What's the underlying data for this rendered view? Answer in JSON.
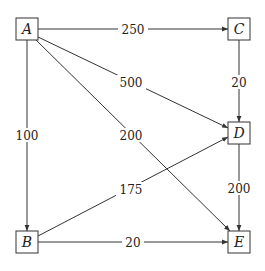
{
  "diagram": {
    "type": "weighted-directed-graph",
    "nodes": [
      {
        "id": "A",
        "label": "A",
        "x": 27,
        "y": 29
      },
      {
        "id": "B",
        "label": "B",
        "x": 27,
        "y": 242
      },
      {
        "id": "C",
        "label": "C",
        "x": 239,
        "y": 29
      },
      {
        "id": "D",
        "label": "D",
        "x": 239,
        "y": 133
      },
      {
        "id": "E",
        "label": "E",
        "x": 239,
        "y": 242
      }
    ],
    "edges": [
      {
        "from": "A",
        "to": "C",
        "weight": "250",
        "label_x": 133,
        "label_y": 29
      },
      {
        "from": "A",
        "to": "D",
        "weight": "500",
        "label_x": 131,
        "label_y": 82
      },
      {
        "from": "A",
        "to": "E",
        "weight": "200",
        "label_x": 131,
        "label_y": 135
      },
      {
        "from": "A",
        "to": "B",
        "weight": "100",
        "label_x": 27,
        "label_y": 135
      },
      {
        "from": "C",
        "to": "D",
        "weight": "20",
        "label_x": 239,
        "label_y": 82
      },
      {
        "from": "D",
        "to": "E",
        "weight": "200",
        "label_x": 239,
        "label_y": 188
      },
      {
        "from": "B",
        "to": "D",
        "weight": "175",
        "label_x": 131,
        "label_y": 189
      },
      {
        "from": "B",
        "to": "E",
        "weight": "20",
        "label_x": 133,
        "label_y": 242
      }
    ]
  },
  "labels": {
    "node_A": "A",
    "node_B": "B",
    "node_C": "C",
    "node_D": "D",
    "node_E": "E",
    "edge_A_C": "250",
    "edge_A_D": "500",
    "edge_A_E": "200",
    "edge_A_B": "100",
    "edge_C_D": "20",
    "edge_D_E": "200",
    "edge_B_D": "175",
    "edge_B_E": "20"
  },
  "colors": {
    "stroke": "#333333",
    "text": "#222222",
    "background": "#ffffff"
  }
}
